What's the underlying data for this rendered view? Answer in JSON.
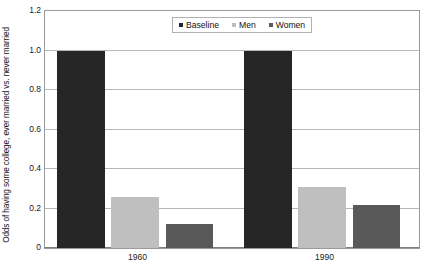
{
  "chart_data": {
    "type": "bar",
    "title": "",
    "subtitle": "",
    "xlabel": "",
    "ylabel": "Odds of having some college, ever married vs. never married",
    "categories": [
      "1960",
      "1990"
    ],
    "series": [
      {
        "name": "Baseline",
        "color": "#262626",
        "values": [
          1.0,
          1.0
        ]
      },
      {
        "name": "Men",
        "color": "#bfbfbf",
        "values": [
          0.26,
          0.31
        ]
      },
      {
        "name": "Women",
        "color": "#595959",
        "values": [
          0.12,
          0.22
        ]
      }
    ],
    "ylim": [
      0,
      1.2
    ],
    "y_ticks": [
      "0",
      "0.2",
      "0.4",
      "0.6",
      "0.8",
      "1.0",
      "1.2"
    ],
    "y_tick_values": [
      0,
      0.2,
      0.4,
      0.6,
      0.8,
      1.0,
      1.2
    ],
    "grid": true,
    "grid_color": "#b7b7b7",
    "legend_position": "top-center",
    "plot_border_color": "#9a9a9a",
    "background": "#ffffff"
  }
}
